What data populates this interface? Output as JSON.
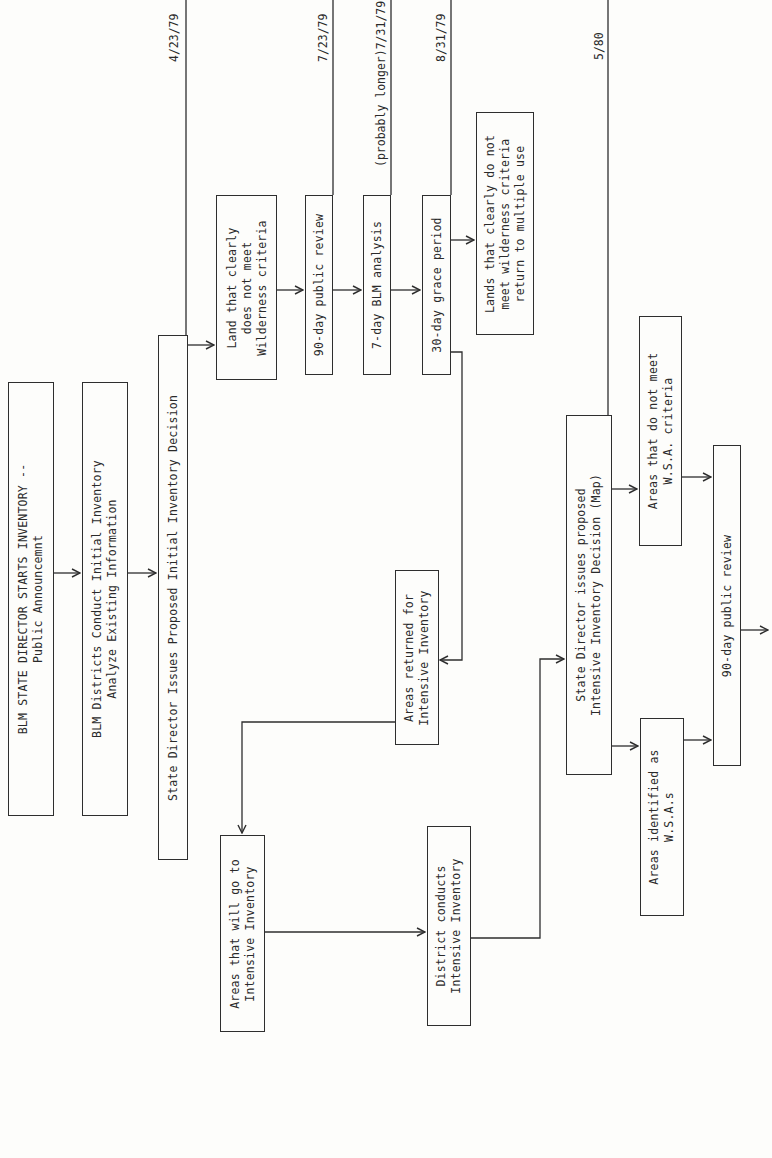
{
  "document": {
    "type": "flowchart",
    "orientation": "rotated-90-ccw",
    "line_color": "#2e2e2e",
    "background": "#fdfdfb"
  },
  "timeline": {
    "dates": [
      {
        "id": "d1",
        "label": "4/23/79"
      },
      {
        "id": "d2",
        "label": "7/23/79"
      },
      {
        "id": "d3",
        "label": "(probably longer)7/31/79"
      },
      {
        "id": "d4",
        "label": "8/31/79"
      },
      {
        "id": "d5",
        "label": "5/80"
      }
    ]
  },
  "boxes": {
    "start": {
      "lines": [
        "BLM STATE DIRECTOR STARTS INVENTORY --",
        "Public Announcemnt"
      ]
    },
    "districts_initial": {
      "lines": [
        "BLM Districts Conduct Initial Inventory",
        "Analyze Existing Information"
      ]
    },
    "proposed_initial": {
      "lines": [
        "State Director Issues Proposed Initial Inventory Decision"
      ]
    },
    "land_not_meet": {
      "lines": [
        "Land that clearly",
        "does not meet",
        "Wilderness criteria"
      ]
    },
    "public_review_1": {
      "lines": [
        "90-day public review"
      ]
    },
    "blm_analysis": {
      "lines": [
        "7-day BLM analysis"
      ]
    },
    "grace_period": {
      "lines": [
        "30-day grace period"
      ]
    },
    "return_multiple_use": {
      "lines": [
        "Lands that clearly do not",
        "meet wilderness criteria",
        "return to multiple use"
      ]
    },
    "areas_returned": {
      "lines": [
        "Areas returned for",
        "Intensive Inventory"
      ]
    },
    "areas_will_go": {
      "lines": [
        "Areas that will go to",
        "Intensive Inventory"
      ]
    },
    "district_conducts": {
      "lines": [
        "District conducts",
        "Intensive Inventory"
      ]
    },
    "proposed_intensive": {
      "lines": [
        "State Director issues proposed",
        "Intensive Inventory Decision (Map)"
      ]
    },
    "not_meet_wsa": {
      "lines": [
        "Areas that do not meet",
        "W.S.A. criteria"
      ]
    },
    "public_review_2": {
      "lines": [
        "90-day public review"
      ]
    },
    "identified_wsa": {
      "lines": [
        "Areas identified as",
        "W.S.A.s"
      ]
    }
  }
}
